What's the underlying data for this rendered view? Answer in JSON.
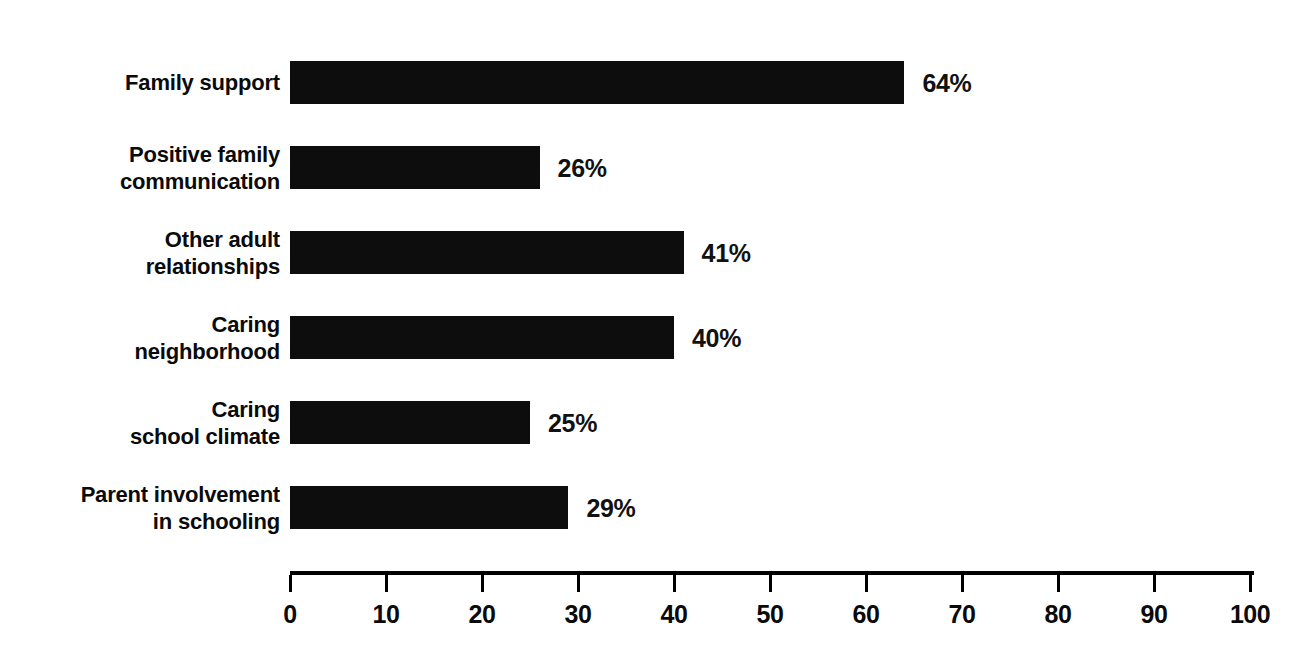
{
  "chart_data": {
    "type": "bar",
    "orientation": "horizontal",
    "title": "",
    "subtitle": "",
    "xlabel": "",
    "ylabel": "",
    "xlim": [
      0,
      100
    ],
    "xticks": [
      0,
      10,
      20,
      30,
      40,
      50,
      60,
      70,
      80,
      90,
      100
    ],
    "xtick_labels": [
      "0",
      "10",
      "20",
      "30",
      "40",
      "50",
      "60",
      "70",
      "80",
      "90",
      "100"
    ],
    "grid": false,
    "legend": null,
    "value_suffix": "%",
    "categories": [
      "Family support",
      "Positive family communication",
      "Other adult relationships",
      "Caring neighborhood",
      "Caring school climate",
      "Parent involvement in schooling"
    ],
    "values": [
      64,
      26,
      41,
      40,
      25,
      29
    ],
    "value_labels": [
      "64%",
      "26%",
      "41%",
      "40%",
      "25%",
      "29%"
    ],
    "bar_color": "#0d0d0d",
    "axis_color": "#000000",
    "background_color": "#ffffff"
  },
  "axis": {
    "ticks": [
      {
        "value": 0,
        "label": "0"
      },
      {
        "value": 10,
        "label": "10"
      },
      {
        "value": 20,
        "label": "20"
      },
      {
        "value": 30,
        "label": "30"
      },
      {
        "value": 40,
        "label": "40"
      },
      {
        "value": 50,
        "label": "50"
      },
      {
        "value": 60,
        "label": "60"
      },
      {
        "value": 70,
        "label": "70"
      },
      {
        "value": 80,
        "label": "80"
      },
      {
        "value": 90,
        "label": "90"
      },
      {
        "value": 100,
        "label": "100"
      }
    ]
  },
  "bars": [
    {
      "label_line1": "Family support",
      "label_line2": "",
      "value": 64,
      "value_label": "64%"
    },
    {
      "label_line1": "Positive family",
      "label_line2": "communication",
      "value": 26,
      "value_label": "26%"
    },
    {
      "label_line1": "Other adult",
      "label_line2": "relationships",
      "value": 41,
      "value_label": "41%"
    },
    {
      "label_line1": "Caring",
      "label_line2": "neighborhood",
      "value": 40,
      "value_label": "40%"
    },
    {
      "label_line1": "Caring",
      "label_line2": "school climate",
      "value": 25,
      "value_label": "25%"
    },
    {
      "label_line1": "Parent involvement",
      "label_line2": "in schooling",
      "value": 29,
      "value_label": "29%"
    }
  ]
}
